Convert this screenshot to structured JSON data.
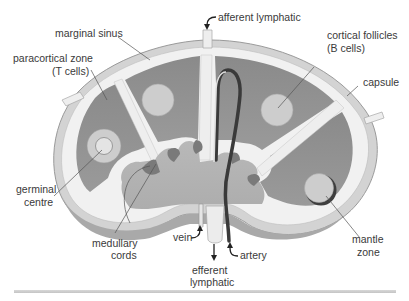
{
  "colors": {
    "capsule": "#d6d6d6",
    "sinus": "#f2f2f2",
    "cortex": "#8e8e8e",
    "follicle": "#cfcfcf",
    "medulla": "#b4b4b4",
    "cord": "#777777",
    "artery": "#3c3c3c",
    "vein": "#e8e8e8",
    "label": "#3a3a3a"
  },
  "labels": {
    "afferent_lymphatic": "afferent lymphatic",
    "marginal_sinus": "marginal sinus",
    "paracortical_zone_line1": "paracortical zone",
    "paracortical_zone_line2": "(T cells)",
    "cortical_follicles_line1": "cortical follicles",
    "cortical_follicles_line2": "(B cells)",
    "capsule": "capsule",
    "germinal_centre_line1": "germinal",
    "germinal_centre_line2": "centre",
    "medullary_cords_line1": "medullary",
    "medullary_cords_line2": "cords",
    "vein": "vein",
    "artery": "artery",
    "efferent_lymphatic_line1": "efferent",
    "efferent_lymphatic_line2": "lymphatic",
    "mantle_zone_line1": "mantle",
    "mantle_zone_line2": "zone"
  }
}
